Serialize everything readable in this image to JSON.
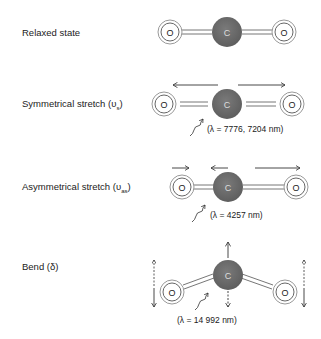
{
  "modes": [
    {
      "label": "Relaxed state",
      "wavelength": ""
    },
    {
      "label": "Symmetrical stretch (υs)",
      "label_main": "Symmetrical stretch (υ",
      "label_sub": "s",
      "wavelength": "(λ = 7776, 7204 nm)"
    },
    {
      "label": "Asymmetrical stretch (υas)",
      "label_main": "Asymmetrical stretch (υ",
      "label_sub": "as",
      "wavelength": "(λ = 4257 nm)"
    },
    {
      "label": "Bend (δ)",
      "wavelength": "(λ = 14 992 nm)"
    }
  ],
  "atoms": {
    "oxygen": "O",
    "carbon": "C"
  },
  "colors": {
    "carbon": "#6b6b6b",
    "oxygen_fill": "#ffffff",
    "stroke": "#555555",
    "bond": "#777777"
  }
}
